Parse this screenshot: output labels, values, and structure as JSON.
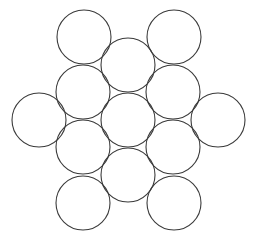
{
  "figure": {
    "canvas": {
      "width": 256,
      "height": 245,
      "background_color": "#ffffff"
    },
    "style": {
      "stroke_color": "#3a3a3a",
      "stroke_width": 1.1,
      "fill_color": "none"
    },
    "circle_count": 13,
    "radius": 27
  },
  "chart_data": {
    "type": "scatter",
    "subtitle": "",
    "xlabel": "",
    "ylabel": "",
    "xlim": [
      0,
      256
    ],
    "ylim": [
      0,
      245
    ],
    "grid": false,
    "legend": "none",
    "marker": "open-circle",
    "marker_radius": 27,
    "rows": [
      {
        "row_label": "top",
        "count": 2
      },
      {
        "row_label": "upper-inner",
        "count": 1
      },
      {
        "row_label": "upper-middle",
        "count": 2
      },
      {
        "row_label": "center",
        "count": 3
      },
      {
        "row_label": "lower-middle",
        "count": 2
      },
      {
        "row_label": "lower-inner",
        "count": 1
      },
      {
        "row_label": "bottom",
        "count": 2
      }
    ],
    "circles": [
      {
        "id": "c1",
        "name": "top-left-circle",
        "cx": 84,
        "cy": 37,
        "r": 27
      },
      {
        "id": "c2",
        "name": "top-right-circle",
        "cx": 174,
        "cy": 37,
        "r": 27
      },
      {
        "id": "c3",
        "name": "upper-center-circle",
        "cx": 128,
        "cy": 65,
        "r": 27
      },
      {
        "id": "c4",
        "name": "upper-left-circle",
        "cx": 83,
        "cy": 92,
        "r": 27
      },
      {
        "id": "c5",
        "name": "upper-right-circle",
        "cx": 173,
        "cy": 92,
        "r": 27
      },
      {
        "id": "c6",
        "name": "far-left-circle",
        "cx": 39,
        "cy": 120,
        "r": 27
      },
      {
        "id": "c7",
        "name": "center-circle",
        "cx": 128,
        "cy": 120,
        "r": 27
      },
      {
        "id": "c8",
        "name": "far-right-circle",
        "cx": 218,
        "cy": 120,
        "r": 27
      },
      {
        "id": "c9",
        "name": "lower-left-circle",
        "cx": 83,
        "cy": 147,
        "r": 27
      },
      {
        "id": "c10",
        "name": "lower-right-circle",
        "cx": 173,
        "cy": 147,
        "r": 27
      },
      {
        "id": "c11",
        "name": "lower-center-circle",
        "cx": 128,
        "cy": 175,
        "r": 27
      },
      {
        "id": "c12",
        "name": "bottom-left-circle",
        "cx": 83,
        "cy": 203,
        "r": 27
      },
      {
        "id": "c13",
        "name": "bottom-right-circle",
        "cx": 174,
        "cy": 203,
        "r": 27
      }
    ]
  }
}
